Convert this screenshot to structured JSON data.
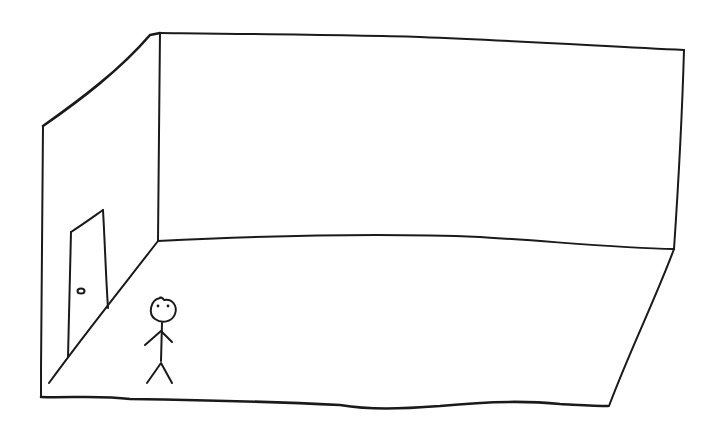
{
  "scene": {
    "title": "Hand-drawn sketch of an empty room",
    "ink_color": "#1a1a1a",
    "background_color": "#ffffff",
    "elements": [
      {
        "name": "back-wall",
        "label": "Back wall"
      },
      {
        "name": "left-wall",
        "label": "Left wall"
      },
      {
        "name": "floor",
        "label": "Floor"
      },
      {
        "name": "door",
        "label": "Door"
      },
      {
        "name": "door-knob",
        "label": "Door knob"
      },
      {
        "name": "stick-figure",
        "label": "Stick figure person"
      }
    ]
  }
}
